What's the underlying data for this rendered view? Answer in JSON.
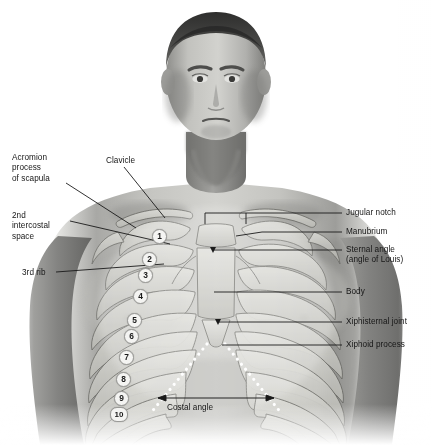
{
  "figure": {
    "background_color": "#ffffff",
    "width": 432,
    "height": 445
  },
  "labels_left": [
    {
      "id": "acromion",
      "text": "Acromion\nprocess\nof scapula",
      "x": 12,
      "y": 153
    },
    {
      "id": "second-intercostal-space",
      "text": "2nd\nintercostal\nspace",
      "x": 12,
      "y": 211
    },
    {
      "id": "third-rib",
      "text": "3rd rib",
      "x": 22,
      "y": 268
    }
  ],
  "labels_center": [
    {
      "id": "clavicle",
      "text": "Clavicle",
      "x": 106,
      "y": 156
    },
    {
      "id": "costal-angle",
      "text": "Costal angle",
      "x": 167,
      "y": 403
    }
  ],
  "labels_right": [
    {
      "id": "jugular-notch",
      "text": "Jugular notch",
      "x": 346,
      "y": 208
    },
    {
      "id": "manubrium",
      "text": "Manubrium",
      "x": 346,
      "y": 227
    },
    {
      "id": "sternal-angle",
      "text": "Sternal angle\n(angle of Louis)",
      "x": 346,
      "y": 245
    },
    {
      "id": "body",
      "text": "Body",
      "x": 346,
      "y": 287
    },
    {
      "id": "xiphisternal-joint",
      "text": "Xiphisternal joint",
      "x": 346,
      "y": 317
    },
    {
      "id": "xiphoid-process",
      "text": "Xiphoid process",
      "x": 346,
      "y": 340
    }
  ],
  "rib_numbers": [
    {
      "n": "1",
      "x": 152,
      "y": 229
    },
    {
      "n": "2",
      "x": 142,
      "y": 252
    },
    {
      "n": "3",
      "x": 138,
      "y": 268
    },
    {
      "n": "4",
      "x": 133,
      "y": 289
    },
    {
      "n": "5",
      "x": 127,
      "y": 313
    },
    {
      "n": "6",
      "x": 124,
      "y": 329
    },
    {
      "n": "7",
      "x": 119,
      "y": 350
    },
    {
      "n": "8",
      "x": 116,
      "y": 372
    },
    {
      "n": "9",
      "x": 114,
      "y": 391
    },
    {
      "n": "10",
      "x": 110,
      "y": 407
    }
  ],
  "colors": {
    "label_text": "#161616",
    "leader_line": "#1a1a1a",
    "costal_margin_dots": "#ffffff",
    "rib_badge_fill": "#f4f4f2",
    "rib_badge_stroke": "#9a9a97",
    "skin_mid": "#a9a9a6",
    "skin_light": "#d8d8d5",
    "skin_dark": "#6f6f6d",
    "bone_overlay": "#c9c9c4"
  }
}
